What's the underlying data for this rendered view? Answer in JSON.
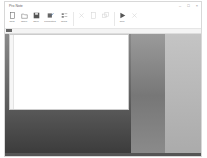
{
  "window": {
    "title": "Pro Note",
    "controls": {
      "minimize": "–",
      "maximize": "□",
      "close": "×"
    }
  },
  "ribbon": {
    "buttons": [
      {
        "id": "new",
        "label": "New",
        "icon": "new-file-icon",
        "enabled": true
      },
      {
        "id": "open",
        "label": "Open",
        "icon": "folder-open-icon",
        "enabled": true
      },
      {
        "id": "save",
        "label": "Save",
        "icon": "save-icon",
        "enabled": true
      },
      {
        "id": "properties",
        "label": "Properties",
        "icon": "properties-icon",
        "enabled": true
      },
      {
        "id": "small-group",
        "label": "Tools",
        "icon": "tools-icon",
        "enabled": true
      },
      {
        "id": "cut",
        "label": "",
        "icon": "cut-icon",
        "enabled": false
      },
      {
        "id": "paste",
        "label": "",
        "icon": "paste-icon",
        "enabled": false
      },
      {
        "id": "copy",
        "label": "",
        "icon": "copy-icon",
        "enabled": false
      },
      {
        "id": "run",
        "label": "Run",
        "icon": "play-icon",
        "enabled": true
      },
      {
        "id": "stop",
        "label": "",
        "icon": "stop-icon",
        "enabled": false
      }
    ]
  },
  "tabstrip": {
    "active_tab": ""
  },
  "colors": {
    "accent": "#2a5d9a",
    "disabled": "#cfcfcf",
    "icon": "#555555"
  }
}
